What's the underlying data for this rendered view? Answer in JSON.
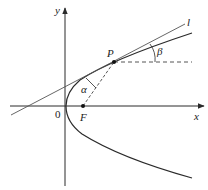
{
  "diagram": {
    "labels": {
      "y_axis": "y",
      "x_axis": "x",
      "origin": "0",
      "point_p": "P",
      "focus": "F",
      "tangent_line": "l",
      "angle_alpha": "α",
      "angle_beta": "β"
    },
    "colors": {
      "stroke": "#2a2a2a",
      "background": "#ffffff"
    }
  }
}
